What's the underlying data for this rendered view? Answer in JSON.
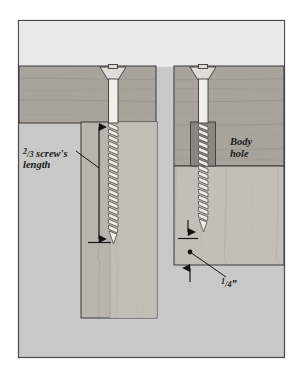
{
  "figure": {
    "panel": {
      "background_color": "#c9c9c9",
      "sky_color": "#e9e9e9",
      "border_color": "#4a4a4a"
    },
    "colors": {
      "wood_top_board": "#a8a49c",
      "wood_lower_board": "#b9b5ad",
      "wood_lower_board_light": "#c4c0b8",
      "body_hole_shade": "#8a8780",
      "screw_shank": "#f2f0ea",
      "screw_thread_light": "#efede7",
      "screw_thread_dark": "#55534e",
      "outline": "#3d3b38",
      "label_text": "#1a1a1a",
      "arrow": "#141414"
    },
    "labels": [
      {
        "id": "two-thirds-screw-length",
        "text": "2/3 screw's length",
        "line1_numerator": "2",
        "line1_solidus": "/",
        "line1_denominator": "3",
        "line1_rest": " screw's",
        "line2": "length",
        "style": "italic",
        "diagram": "left"
      },
      {
        "id": "body-hole",
        "text": "Body hole",
        "line1": "Body",
        "line2": "hole",
        "style": "italic",
        "diagram": "right"
      },
      {
        "id": "quarter-inch",
        "text": "1/4\"",
        "numerator": "1",
        "solidus": "/",
        "denominator": "4",
        "unit": "”",
        "style": "italic",
        "diagram": "right"
      }
    ],
    "left_diagram": {
      "name": "pilot-hole-depth-diagram",
      "description": "Screw through top board into lower board with pilot hole; vertical dimension arrow marks 2/3 of screw's length",
      "screw_head": "countersunk-slotted",
      "annotation": "2/3 screw's length"
    },
    "right_diagram": {
      "name": "body-hole-diagram",
      "description": "Screw through top board with body hole clearance, threads engaging lower board; arrows mark 1/4 inch from bottom",
      "screw_head": "countersunk-slotted",
      "annotations": [
        "Body hole",
        "1/4\""
      ]
    }
  }
}
